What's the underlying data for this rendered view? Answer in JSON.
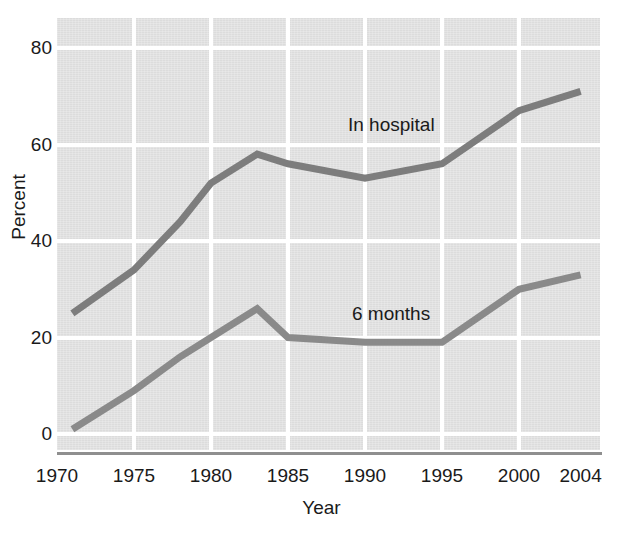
{
  "chart_data": {
    "type": "line",
    "title": "",
    "xlabel": "Year",
    "ylabel": "Percent",
    "xlim": [
      1970,
      2004
    ],
    "ylim": [
      0,
      80
    ],
    "grid": true,
    "legend_position": "inline-annotation",
    "xticks": [
      "1970",
      "1975",
      "1980",
      "1985",
      "1990",
      "1995",
      "2000",
      "2004"
    ],
    "xtick_values": [
      1970,
      1975,
      1980,
      1985,
      1990,
      1995,
      2000,
      2004
    ],
    "yticks": [
      "0",
      "20",
      "40",
      "60",
      "80"
    ],
    "ytick_values": [
      0,
      20,
      40,
      60,
      80
    ],
    "series": [
      {
        "name": "In hospital",
        "color": "#7d7d7d",
        "label_text": "In hospital",
        "x": [
          1971,
          1975,
          1978,
          1980,
          1983,
          1985,
          1990,
          1995,
          2000,
          2004
        ],
        "values": [
          25,
          34,
          44,
          52,
          58,
          56,
          53,
          56,
          67,
          71
        ]
      },
      {
        "name": "6 months",
        "color": "#8a8a8a",
        "label_text": "6 months",
        "x": [
          1971,
          1975,
          1978,
          1980,
          1983,
          1985,
          1990,
          1995,
          2000,
          2004
        ],
        "values": [
          1,
          9,
          16,
          20,
          26,
          20,
          19,
          19,
          30,
          33
        ]
      }
    ]
  },
  "axes": {
    "y_title": "Percent",
    "x_title": "Year"
  },
  "colors": {
    "plot_background": "#dcdcdc",
    "gridline": "#ffffff",
    "axis_line": "#8f8f8f",
    "text": "#1a1a1a",
    "series_in_hospital": "#7d7d7d",
    "series_6_months": "#8a8a8a"
  }
}
